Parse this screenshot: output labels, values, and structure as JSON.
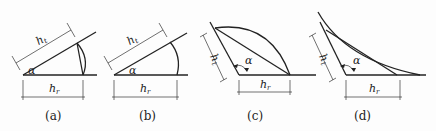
{
  "figure": {
    "panels": [
      {
        "id": "a",
        "caption": "(a)",
        "angle_symbol": "α",
        "incline_dim": {
          "main": "h",
          "sub": "t"
        },
        "base_dim": {
          "main": "h",
          "sub": "r"
        }
      },
      {
        "id": "b",
        "caption": "(b)",
        "angle_symbol": "α",
        "incline_dim": {
          "main": "h",
          "sub": "t"
        },
        "base_dim": {
          "main": "h",
          "sub": "r"
        }
      },
      {
        "id": "c",
        "caption": "(c)",
        "angle_symbol": "α",
        "incline_dim": {
          "main": "h",
          "sub": "t"
        },
        "base_dim": {
          "main": "h",
          "sub": "r"
        }
      },
      {
        "id": "d",
        "caption": "(d)",
        "angle_symbol": "α",
        "incline_dim": {
          "main": "h",
          "sub": "t"
        },
        "base_dim": {
          "main": "h",
          "sub": "r"
        }
      }
    ],
    "colors": {
      "line": "#222222",
      "background": "#fdfdfd"
    }
  }
}
